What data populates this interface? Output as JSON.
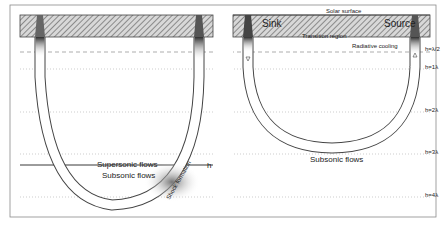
{
  "figure": {
    "orientation": "rotated-180",
    "colors": {
      "frame": "#8a8a8a",
      "hatch": "#555555",
      "loop_dark": "#3a3a3a",
      "text": "#222222"
    },
    "height_labels": [
      "h=λ/2",
      "h=1λ",
      "h=2λ",
      "h=3λ",
      "h=4λ"
    ],
    "left_panel": {
      "flow_labels": {
        "accelerating": "Accelerating flows",
        "decelerating": "Decelerating flows",
        "supersonic": "Supersonic flows",
        "subsonic": "Subsonic flows",
        "shock": "Shock formation",
        "hs": "h",
        "hs_sub": "s"
      }
    },
    "right_panel": {
      "surface_label": "Solar surface",
      "source_label": "Source",
      "sink_label": "Sink",
      "transition_label": "Transition region",
      "cooling_label": "Radiative cooling",
      "flow_labels": {
        "accelerating": "Accelerating flows",
        "decelerating": "Decelerating flows",
        "subsonic": "Subsonic flows"
      }
    }
  }
}
